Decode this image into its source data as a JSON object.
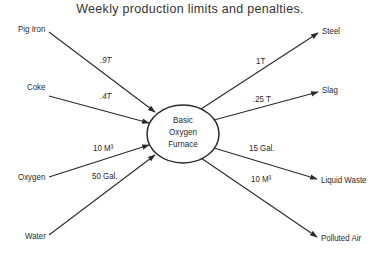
{
  "title": "Weekly production limits and penalties.",
  "center_node": {
    "lines": [
      "Basic",
      "Oxygen",
      "Furnace"
    ]
  },
  "inputs": [
    {
      "label": "Pig Iron",
      "value": ".9T"
    },
    {
      "label": "Coke",
      "value": ".4T"
    },
    {
      "label": "Oxygen",
      "value": "10 M³"
    },
    {
      "label": "Water",
      "value": "50 Gal."
    }
  ],
  "outputs": [
    {
      "label": "Steel",
      "value": "1T"
    },
    {
      "label": "Slag",
      "value": ".25 T"
    },
    {
      "label": "Liquid Waste",
      "value": "15 Gal."
    },
    {
      "label": "Polluted Air",
      "value": "10 M³"
    }
  ],
  "colors": {
    "line": "#2a2a2a",
    "background": "#ffffff"
  }
}
